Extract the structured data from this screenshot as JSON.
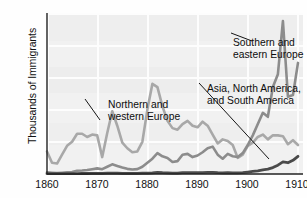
{
  "chart_data": {
    "type": "line",
    "title": "",
    "subtitle": "",
    "xlabel": "",
    "ylabel": "Thousands of Immigrants",
    "xlim": [
      1860,
      1911
    ],
    "ylim": [
      0,
      1000
    ],
    "grid": true,
    "legend_position": "inline-annotations",
    "x_ticks": [
      "1860",
      "1870",
      "1880",
      "1890",
      "1900",
      "1910"
    ],
    "x_tick_values": [
      1860,
      1870,
      1880,
      1890,
      1900,
      1910
    ],
    "y_ticks": [
      "0",
      "200",
      "400",
      "600",
      "800",
      "1000"
    ],
    "y_tick_values": [
      0,
      200,
      400,
      600,
      800,
      1000
    ],
    "annotations": [
      {
        "id": "northern-western-europe",
        "text_line1": "Northern and",
        "text_line2": "western Europe",
        "points_to_series": "Northern and western Europe"
      },
      {
        "id": "southern-eastern-europe",
        "text_line1": "Southern and",
        "text_line2": "eastern Europe",
        "points_to_series": "Southern and eastern Europe"
      },
      {
        "id": "asia-north-south-america",
        "text_line1": "Asia, North America,",
        "text_line2": "and South America",
        "points_to_series": "Asia, North America, and South America"
      }
    ],
    "x": [
      1860,
      1861,
      1862,
      1863,
      1864,
      1865,
      1866,
      1867,
      1868,
      1869,
      1870,
      1871,
      1872,
      1873,
      1874,
      1875,
      1876,
      1877,
      1878,
      1879,
      1880,
      1881,
      1882,
      1883,
      1884,
      1885,
      1886,
      1887,
      1888,
      1889,
      1890,
      1891,
      1892,
      1893,
      1894,
      1895,
      1896,
      1897,
      1898,
      1899,
      1900,
      1901,
      1902,
      1903,
      1904,
      1905,
      1906,
      1907,
      1908,
      1909,
      1910
    ],
    "series": [
      {
        "name": "Northern and western Europe",
        "color": "#a8a8a8",
        "values": [
          140,
          70,
          65,
          120,
          175,
          200,
          250,
          250,
          230,
          245,
          240,
          105,
          255,
          390,
          300,
          195,
          160,
          135,
          140,
          200,
          400,
          560,
          540,
          420,
          330,
          285,
          275,
          310,
          330,
          300,
          290,
          325,
          300,
          245,
          190,
          215,
          205,
          180,
          100,
          120,
          175,
          195,
          230,
          245,
          215,
          240,
          240,
          235,
          185,
          210,
          180
        ]
      },
      {
        "name": "Southern and eastern Europe",
        "color": "#8c8c8c",
        "values": [
          10,
          8,
          6,
          8,
          10,
          12,
          20,
          22,
          25,
          30,
          35,
          30,
          45,
          60,
          50,
          40,
          32,
          28,
          30,
          45,
          70,
          95,
          130,
          110,
          100,
          75,
          80,
          120,
          125,
          105,
          115,
          135,
          160,
          170,
          120,
          95,
          125,
          110,
          105,
          130,
          180,
          240,
          310,
          380,
          355,
          540,
          620,
          950,
          480,
          490,
          690
        ]
      },
      {
        "name": "Asia, North America, and South America",
        "color": "#4a4a4a",
        "values": [
          2,
          2,
          2,
          2,
          2,
          2,
          2,
          3,
          3,
          4,
          4,
          4,
          5,
          6,
          5,
          4,
          4,
          4,
          4,
          5,
          6,
          7,
          10,
          8,
          7,
          6,
          6,
          8,
          9,
          8,
          8,
          9,
          10,
          10,
          8,
          7,
          8,
          7,
          7,
          8,
          12,
          16,
          20,
          26,
          30,
          40,
          55,
          75,
          70,
          85,
          110
        ]
      }
    ]
  }
}
